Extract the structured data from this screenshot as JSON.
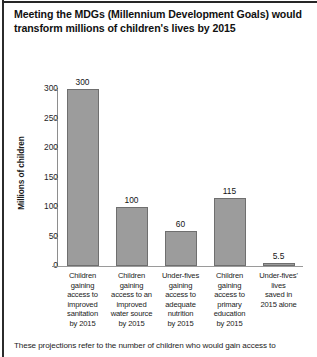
{
  "title": "Meeting the MDGs (Millennium Development Goals) would transform millions of children's lives by 2015",
  "footer": "These projections refer to the number of children who would gain access to",
  "chart_data": {
    "type": "bar",
    "title": "Meeting the MDGs (Millennium Development Goals) would transform millions of children's lives by 2015",
    "xlabel": "",
    "ylabel": "Millions of children",
    "ylim": [
      0,
      300
    ],
    "yticks": [
      0,
      50,
      100,
      150,
      200,
      250,
      300
    ],
    "ytick_labels": [
      "0",
      "50",
      "100",
      "150",
      "200",
      "250",
      "300"
    ],
    "grid": false,
    "legend": "none",
    "bar_color": "#9c9c9c",
    "bar_edge_color": "#6f6f6f",
    "categories": [
      "Children gaining access to improved sanitation by 2015",
      "Children gaining access to an improved water source by 2015",
      "Under-fives gaining access to adequate nutrition by 2015",
      "Children gaining access to primary education by 2015",
      "Under-fives' lives saved in 2015 alone"
    ],
    "category_lines": [
      [
        "Children",
        "gaining",
        "access to",
        "improved",
        "sanitation",
        "by 2015"
      ],
      [
        "Children",
        "gaining",
        "access to an",
        "improved",
        "water source",
        "by 2015"
      ],
      [
        "Under-fives",
        "gaining",
        "access to",
        "adequate",
        "nutrition",
        "by 2015"
      ],
      [
        "Children",
        "gaining",
        "access to",
        "primary",
        "education",
        "by 2015"
      ],
      [
        "Under-fives'",
        "lives",
        "saved in",
        "2015 alone"
      ]
    ],
    "values": [
      300,
      100,
      60,
      115,
      5.5
    ],
    "value_labels": [
      "300",
      "100",
      "60",
      "115",
      "5.5"
    ]
  }
}
